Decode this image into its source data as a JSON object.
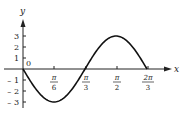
{
  "chart_data": {
    "type": "line",
    "title": "",
    "xlabel": "x",
    "ylabel": "y",
    "function": "y = -3 sin(3x)",
    "x_ticks": [
      "π/6",
      "π/3",
      "π/2",
      "2π/3"
    ],
    "y_ticks": [
      "3",
      "2",
      "1",
      "-1",
      "-2",
      "-3"
    ],
    "origin_label": "0",
    "xlim": [
      0,
      2.2
    ],
    "ylim": [
      -3.5,
      3.5
    ],
    "points": [
      {
        "x": 0,
        "y": 0
      },
      {
        "x": 0.5236,
        "y": -3
      },
      {
        "x": 1.0472,
        "y": 0
      },
      {
        "x": 1.5708,
        "y": 3
      },
      {
        "x": 2.0944,
        "y": 0
      }
    ],
    "grid": false,
    "legend": null
  },
  "labels": {
    "x_axis": "x",
    "y_axis": "y",
    "origin": "0",
    "xt": [
      {
        "num": "π",
        "den": "6"
      },
      {
        "num": "π",
        "den": "3"
      },
      {
        "num": "π",
        "den": "2"
      },
      {
        "num": "2π",
        "den": "3"
      }
    ],
    "yt": [
      "3",
      "2",
      "1",
      "– 1",
      "– 2",
      "– 3"
    ]
  }
}
